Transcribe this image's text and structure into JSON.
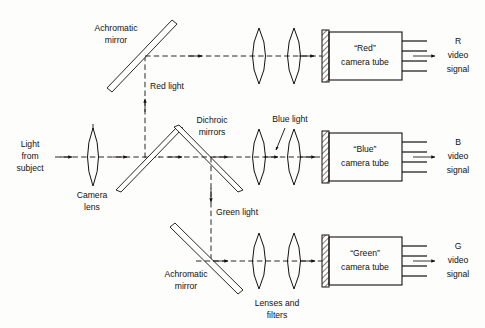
{
  "diagram": {
    "labels": {
      "light_from_subject_1": "Light",
      "light_from_subject_2": "from",
      "light_from_subject_3": "subject",
      "camera_lens_1": "Camera",
      "camera_lens_2": "lens",
      "achromatic_mirror_top_1": "Achromatic",
      "achromatic_mirror_top_2": "mirror",
      "achromatic_mirror_bottom_1": "Achromatic",
      "achromatic_mirror_bottom_2": "mirror",
      "dichroic_mirrors_1": "Dichroic",
      "dichroic_mirrors_2": "mirrors",
      "red_light": "Red light",
      "blue_light": "Blue light",
      "green_light": "Green light",
      "lenses_and_filters_1": "Lenses and",
      "lenses_and_filters_2": "filters"
    },
    "tubes": [
      {
        "name": "red-camera-tube",
        "line1": "“Red”",
        "line2": "camera tube",
        "signal_letter": "R",
        "signal_line2": "video",
        "signal_line3": "signal"
      },
      {
        "name": "blue-camera-tube",
        "line1": "“Blue”",
        "line2": "camera tube",
        "signal_letter": "B",
        "signal_line2": "video",
        "signal_line3": "signal"
      },
      {
        "name": "green-camera-tube",
        "line1": "“Green”",
        "line2": "camera tube",
        "signal_letter": "G",
        "signal_line2": "video",
        "signal_line3": "signal"
      }
    ],
    "colors": {
      "ink": "#14110f",
      "background": "#fdfdfb"
    }
  }
}
